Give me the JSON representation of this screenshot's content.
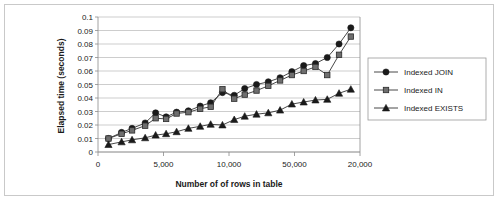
{
  "chart_data": {
    "type": "line",
    "title": "",
    "xlabel": "Number of of rows in table",
    "ylabel": "Elapsed time (seconds)",
    "ylim": [
      0,
      0.1
    ],
    "ytick_labels": [
      "0",
      "0.01",
      "0.02",
      "0.03",
      "0.04",
      "0.05",
      "0.06",
      "0.07",
      "0.08",
      "0.09",
      "0.1"
    ],
    "ytick_values": [
      0,
      0.01,
      0.02,
      0.03,
      0.04,
      0.05,
      0.06,
      0.07,
      0.08,
      0.09,
      0.1
    ],
    "xtick_labels": [
      "0",
      "5,000",
      "10,000",
      "50,000",
      "20,000"
    ],
    "xtick_positions": [
      0,
      0.25,
      0.5,
      0.75,
      1.0
    ],
    "grid": "horizontal",
    "legend_position": "right",
    "x": [
      0.04,
      0.09,
      0.13,
      0.18,
      0.22,
      0.26,
      0.3,
      0.345,
      0.39,
      0.43,
      0.475,
      0.52,
      0.56,
      0.605,
      0.65,
      0.695,
      0.74,
      0.785,
      0.83,
      0.875,
      0.92,
      0.965
    ],
    "series": [
      {
        "name": "Indexed JOIN",
        "marker": "circle",
        "color": "#1a1a1a",
        "values": [
          0.01,
          0.0145,
          0.0175,
          0.0215,
          0.029,
          0.026,
          0.0295,
          0.0305,
          0.034,
          0.0365,
          0.044,
          0.042,
          0.047,
          0.05,
          0.052,
          0.055,
          0.0595,
          0.064,
          0.0655,
          0.07,
          0.08,
          0.092
        ]
      },
      {
        "name": "Indexed IN",
        "marker": "square",
        "color": "#6e6e6e",
        "values": [
          0.01,
          0.0135,
          0.016,
          0.0195,
          0.025,
          0.0245,
          0.0285,
          0.0295,
          0.032,
          0.0335,
          0.0465,
          0.0395,
          0.0425,
          0.0455,
          0.049,
          0.053,
          0.057,
          0.06,
          0.063,
          0.057,
          0.072,
          0.0855
        ]
      },
      {
        "name": "Indexed EXISTS",
        "marker": "triangle",
        "color": "#1a1a1a",
        "values": [
          0.0055,
          0.0075,
          0.009,
          0.0105,
          0.0125,
          0.0135,
          0.015,
          0.0175,
          0.019,
          0.0205,
          0.02,
          0.024,
          0.0265,
          0.028,
          0.029,
          0.031,
          0.0355,
          0.037,
          0.0385,
          0.039,
          0.0435,
          0.0465
        ]
      }
    ]
  },
  "legend": {
    "items": [
      {
        "label": "Indexed JOIN"
      },
      {
        "label": "Indexed IN"
      },
      {
        "label": "Indexed EXISTS"
      }
    ]
  }
}
